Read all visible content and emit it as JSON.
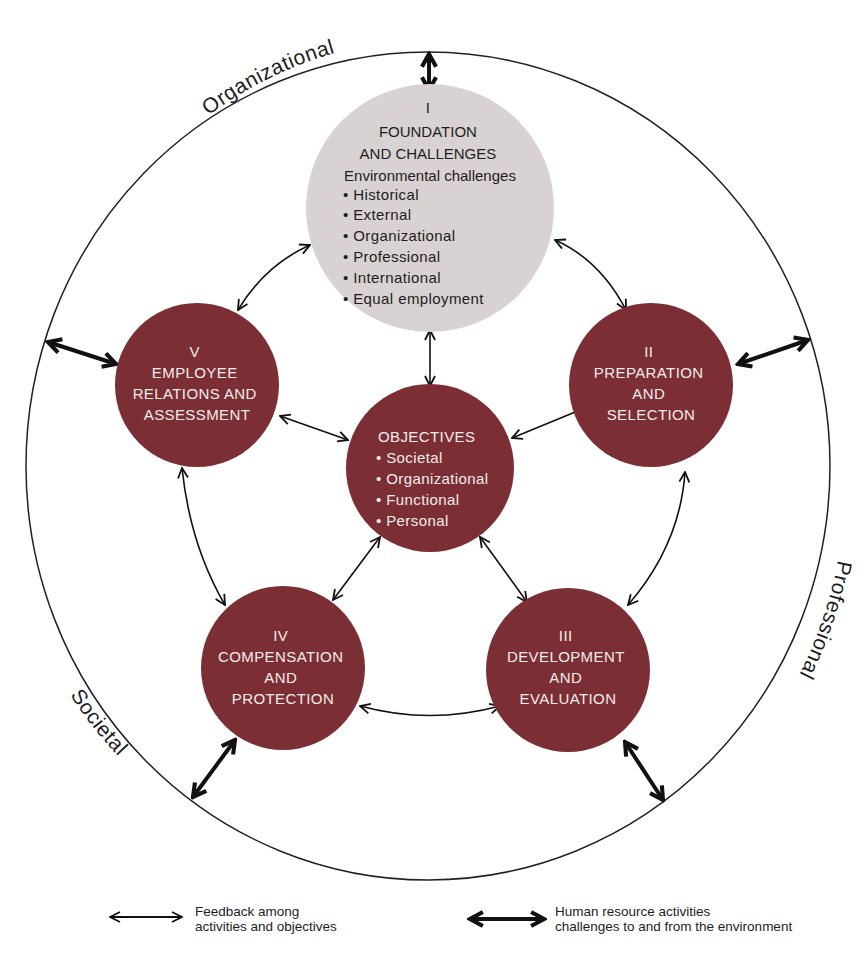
{
  "environment_labels": {
    "top": "Organizational",
    "right": "Professional",
    "bottom_left": "Societal"
  },
  "nodes": {
    "foundation": {
      "numeral": "I",
      "title_line1": "FOUNDATION",
      "title_line2": "AND CHALLENGES",
      "subtitle": "Environmental challenges",
      "items": [
        "• Historical",
        "• External",
        "• Organizational",
        "• Professional",
        "• International",
        "• Equal employment"
      ],
      "color": "#d9d2d3"
    },
    "preparation": {
      "numeral": "II",
      "lines": [
        "PREPARATION",
        "AND",
        "SELECTION"
      ],
      "color": "#7b2e34"
    },
    "development": {
      "numeral": "III",
      "lines": [
        "DEVELOPMENT",
        "AND",
        "EVALUATION"
      ],
      "color": "#7b2e34"
    },
    "compensation": {
      "numeral": "IV",
      "lines": [
        "COMPENSATION",
        "AND",
        "PROTECTION"
      ],
      "color": "#7b2e34"
    },
    "employee_relations": {
      "numeral": "V",
      "lines": [
        "EMPLOYEE",
        "RELATIONS AND",
        "ASSESSMENT"
      ],
      "color": "#7b2e34"
    },
    "objectives": {
      "title": "OBJECTIVES",
      "items": [
        "• Societal",
        "• Organizational",
        "• Functional",
        "• Personal"
      ],
      "color": "#7b2e34"
    }
  },
  "legend": {
    "thin_arrow": {
      "line1": "Feedback among",
      "line2": "activities and objectives"
    },
    "thick_arrow": {
      "line1": "Human resource activities",
      "line2": "challenges to and from the environment"
    }
  }
}
